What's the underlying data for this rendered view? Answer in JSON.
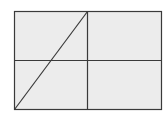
{
  "diagram": {
    "type": "rectangle-grid-with-diagonal",
    "colors": {
      "background": "#ffffff",
      "fill": "#ececec",
      "stroke": "#3a3a3a"
    },
    "rectangle": {
      "x": 14,
      "y": 11,
      "width": 147,
      "height": 98
    },
    "vertical_divider_x": 87,
    "horizontal_divider_y": 60,
    "diagonal": {
      "x1": 14,
      "y1": 109,
      "x2": 87,
      "y2": 11
    }
  }
}
